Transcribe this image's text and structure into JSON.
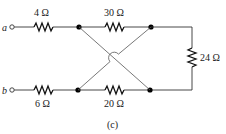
{
  "diagram": {
    "caption": "(c)",
    "terminals": [
      {
        "id": "a",
        "label": "a"
      },
      {
        "id": "b",
        "label": "b"
      }
    ],
    "resistors": [
      {
        "id": "R1",
        "label": "4 Ω",
        "between": [
          "a",
          "top-left-node"
        ]
      },
      {
        "id": "R2",
        "label": "30 Ω",
        "between": [
          "top-left-node",
          "top-right-node"
        ]
      },
      {
        "id": "R3",
        "label": "24 Ω",
        "between": [
          "top-right-node",
          "bottom-right-node"
        ]
      },
      {
        "id": "R4",
        "label": "6 Ω",
        "between": [
          "b",
          "bottom-left-node"
        ]
      },
      {
        "id": "R5",
        "label": "20 Ω",
        "between": [
          "bottom-left-node",
          "bottom-right-node"
        ]
      }
    ],
    "crossing_wires": [
      {
        "from": "top-left-node",
        "to": "bottom-right-node"
      },
      {
        "from": "bottom-left-node",
        "to": "top-right-node",
        "hop_over": true
      }
    ]
  }
}
